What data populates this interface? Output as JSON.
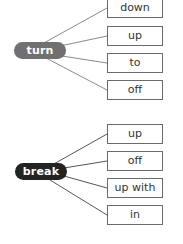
{
  "groups": [
    {
      "verb": "turn",
      "color": "#707070",
      "particles": [
        "down",
        "up",
        "to",
        "off"
      ]
    },
    {
      "verb": "break",
      "color": "#232323",
      "particles": [
        "up",
        "off",
        "up with",
        "in"
      ]
    }
  ]
}
